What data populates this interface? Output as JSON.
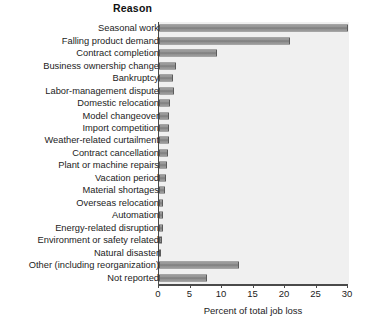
{
  "chart_data": {
    "type": "bar",
    "orientation": "horizontal",
    "title": "Reason",
    "xlabel": "Percent of total job loss",
    "ylabel": "",
    "xlim": [
      0,
      30
    ],
    "xticks": [
      0,
      5,
      10,
      15,
      20,
      25,
      30
    ],
    "xtick_labels": [
      "0",
      "5",
      "10",
      "15",
      "20",
      "25",
      "30"
    ],
    "grid": false,
    "legend": null,
    "categories": [
      "Seasonal work",
      "Falling product demand",
      "Contract completion",
      "Business ownership change",
      "Bankruptcy",
      "Labor-management dispute",
      "Domestic relocation",
      "Model changeover",
      "Import competition",
      "Weather-related curtailment",
      "Contract cancellation",
      "Plant or machine repairs",
      "Vacation period",
      "Material shortages",
      "Overseas relocation",
      "Automation",
      "Energy-related disruption",
      "Environment or safety related",
      "Natural disaster",
      "Other (including reorganization)",
      "Not reported"
    ],
    "values": [
      30.0,
      20.8,
      9.2,
      2.7,
      2.3,
      2.4,
      1.8,
      1.6,
      1.6,
      1.6,
      1.4,
      1.2,
      1.1,
      1.0,
      0.7,
      0.6,
      0.6,
      0.5,
      0.3,
      12.7,
      7.6
    ]
  }
}
